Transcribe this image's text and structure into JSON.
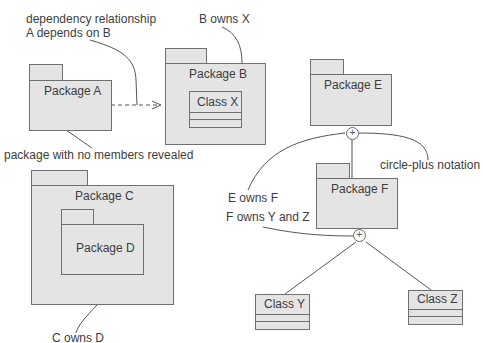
{
  "packages": {
    "a": {
      "name": "Package A"
    },
    "b": {
      "name": "Package B"
    },
    "c": {
      "name": "Package C"
    },
    "d": {
      "name": "Package D"
    },
    "e": {
      "name": "Package E"
    },
    "f": {
      "name": "Package F"
    }
  },
  "classes": {
    "x": {
      "name": "Class X"
    },
    "y": {
      "name": "Class Y"
    },
    "z": {
      "name": "Class Z"
    }
  },
  "annotations": {
    "dependency_line1": "dependency relationship",
    "dependency_line2": "A depends on B",
    "b_owns_x": "B owns X",
    "no_members": "package with no members revealed",
    "c_owns_d": "C owns D",
    "e_owns_f": "E owns F",
    "f_owns_yz": "F owns Y and Z",
    "circle_plus": "circle-plus notation"
  },
  "symbols": {
    "plus": "+"
  }
}
